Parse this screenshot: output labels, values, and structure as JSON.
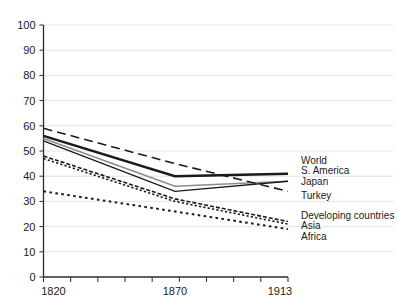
{
  "chart_data": {
    "type": "line",
    "title": "",
    "subtitle": "",
    "xlabel": "",
    "ylabel": "",
    "x": [
      1820,
      1870,
      1913
    ],
    "xlim": [
      1820,
      1913
    ],
    "ylim": [
      0,
      100
    ],
    "x_tick_labels": [
      "1820",
      "1870",
      "1913"
    ],
    "x_tick_values": [
      1820,
      1870,
      1913
    ],
    "y_tick_labels": [
      "0",
      "10",
      "20",
      "30",
      "40",
      "50",
      "60",
      "70",
      "80",
      "90",
      "100"
    ],
    "y_tick_values": [
      0,
      10,
      20,
      30,
      40,
      50,
      60,
      70,
      80,
      90,
      100
    ],
    "grid": "horizontal",
    "legend_position": "right",
    "series": [
      {
        "name": "World",
        "values": [
          56,
          40,
          41
        ],
        "style": "solid",
        "color": "#1a1a1a",
        "width": 2.4
      },
      {
        "name": "S. America",
        "values": [
          55,
          36,
          38
        ],
        "style": "solid",
        "color": "#8c8c8c",
        "width": 1.6
      },
      {
        "name": "Japan",
        "values": [
          54,
          34,
          38
        ],
        "style": "solid",
        "color": "#1a1a1a",
        "width": 1.3
      },
      {
        "name": "Turkey",
        "values": [
          59,
          45,
          34
        ],
        "style": "dashed",
        "color": "#1a1a1a",
        "width": 1.6
      },
      {
        "name": "Developing countries",
        "values": [
          48,
          31,
          22
        ],
        "style": "dashed-fine",
        "color": "#1a1a1a",
        "width": 1.6
      },
      {
        "name": "Asia",
        "values": [
          47,
          30,
          21
        ],
        "style": "dotted",
        "color": "#1a1a1a",
        "width": 1.6
      },
      {
        "name": "Africa",
        "values": [
          34,
          26,
          19
        ],
        "style": "dotted-wide",
        "color": "#1a1a1a",
        "width": 2.0
      }
    ]
  },
  "legend": {
    "items": [
      {
        "label": "World",
        "y": 161
      },
      {
        "label": "S. America",
        "y": 171
      },
      {
        "label": "Japan",
        "y": 182
      },
      {
        "label": "Turkey",
        "y": 196
      },
      {
        "label": "Developing countries",
        "y": 216
      },
      {
        "label": "Asia",
        "y": 226
      },
      {
        "label": "Africa",
        "y": 237
      }
    ]
  },
  "axes": {
    "y_axis_label": "",
    "x_axis_label": ""
  }
}
